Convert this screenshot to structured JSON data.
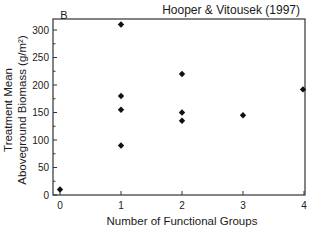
{
  "chart_data": {
    "type": "scatter",
    "panel_label": "B",
    "title": "Hooper & Vitousek (1997)",
    "xlabel": "Number of Functional Groups",
    "ylabel_line1": "Treatment Mean",
    "ylabel_line2": "Aboveground Biomass (g/m²)",
    "xlim": [
      0,
      4
    ],
    "ylim": [
      0,
      320
    ],
    "xticks": [
      0,
      1,
      2,
      3,
      4
    ],
    "xtick_labels": [
      "0",
      "1",
      "2",
      "3",
      "4"
    ],
    "yticks": [
      0,
      50,
      100,
      150,
      200,
      250,
      300
    ],
    "ytick_labels": [
      "0",
      "50",
      "100",
      "150",
      "200",
      "250",
      "300"
    ],
    "y_minor_step": 25,
    "grid": false,
    "legend": null,
    "marker": "diamond",
    "marker_color": "#111111",
    "points": [
      {
        "x": 0,
        "y": 10
      },
      {
        "x": 1,
        "y": 310
      },
      {
        "x": 1,
        "y": 180
      },
      {
        "x": 1,
        "y": 155
      },
      {
        "x": 1,
        "y": 90
      },
      {
        "x": 2,
        "y": 220
      },
      {
        "x": 2,
        "y": 150
      },
      {
        "x": 2,
        "y": 135
      },
      {
        "x": 3,
        "y": 145
      },
      {
        "x": 4,
        "y": 192
      }
    ]
  },
  "layout": {
    "frame": {
      "left": 53,
      "top": 19,
      "right": 305,
      "bottom": 195
    },
    "x0_px": 60,
    "x_px_per_unit": 61,
    "y0_px": 195,
    "y_px_per_unit": 0.55,
    "axis_color": "#333333"
  }
}
